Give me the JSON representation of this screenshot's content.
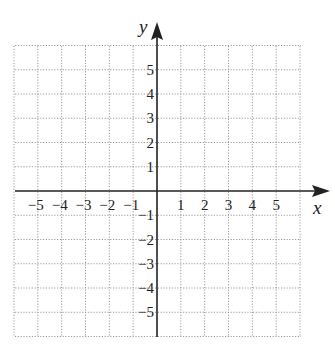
{
  "chart_data": {
    "type": "scatter",
    "title": "",
    "xlabel": "x",
    "ylabel": "y",
    "xlim": [
      -6,
      6
    ],
    "ylim": [
      -6,
      6
    ],
    "grid": true,
    "grid_style": "dotted",
    "series": [],
    "x_ticks": [
      "-5",
      "-4",
      "-3",
      "-2",
      "-1",
      "1",
      "2",
      "3",
      "4",
      "5"
    ],
    "y_ticks": [
      "5",
      "4",
      "3",
      "2",
      "1",
      "-1",
      "-2",
      "-3",
      "-4",
      "-5"
    ]
  },
  "labels": {
    "x_axis": "x",
    "y_axis": "y",
    "x_ticks": [
      {
        "v": -5,
        "t": "−5"
      },
      {
        "v": -4,
        "t": "−4"
      },
      {
        "v": -3,
        "t": "−3"
      },
      {
        "v": -2,
        "t": "−2"
      },
      {
        "v": -1,
        "t": "−1"
      },
      {
        "v": 1,
        "t": "1"
      },
      {
        "v": 2,
        "t": "2"
      },
      {
        "v": 3,
        "t": "3"
      },
      {
        "v": 4,
        "t": "4"
      },
      {
        "v": 5,
        "t": "5"
      }
    ],
    "y_ticks": [
      {
        "v": 5,
        "t": "5"
      },
      {
        "v": 4,
        "t": "4"
      },
      {
        "v": 3,
        "t": "3"
      },
      {
        "v": 2,
        "t": "2"
      },
      {
        "v": 1,
        "t": "1"
      },
      {
        "v": -1,
        "t": "−1"
      },
      {
        "v": -2,
        "t": "−2"
      },
      {
        "v": -3,
        "t": "−3"
      },
      {
        "v": -4,
        "t": "−4"
      },
      {
        "v": -5,
        "t": "−5"
      }
    ]
  },
  "colors": {
    "grid": "#9a9a9a",
    "axis": "#222222"
  }
}
